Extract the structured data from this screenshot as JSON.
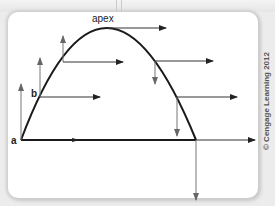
{
  "diagram": {
    "labels": {
      "apex": "apex",
      "point_b": "b",
      "point_a": "a"
    },
    "copyright": "© Cengage Learning 2012",
    "colors": {
      "curve": "#1a1a1a",
      "horizontal_arrows": "#333333",
      "vertical_arrows": "#555555",
      "panel": "#ffffff",
      "background": "#ececec"
    }
  }
}
